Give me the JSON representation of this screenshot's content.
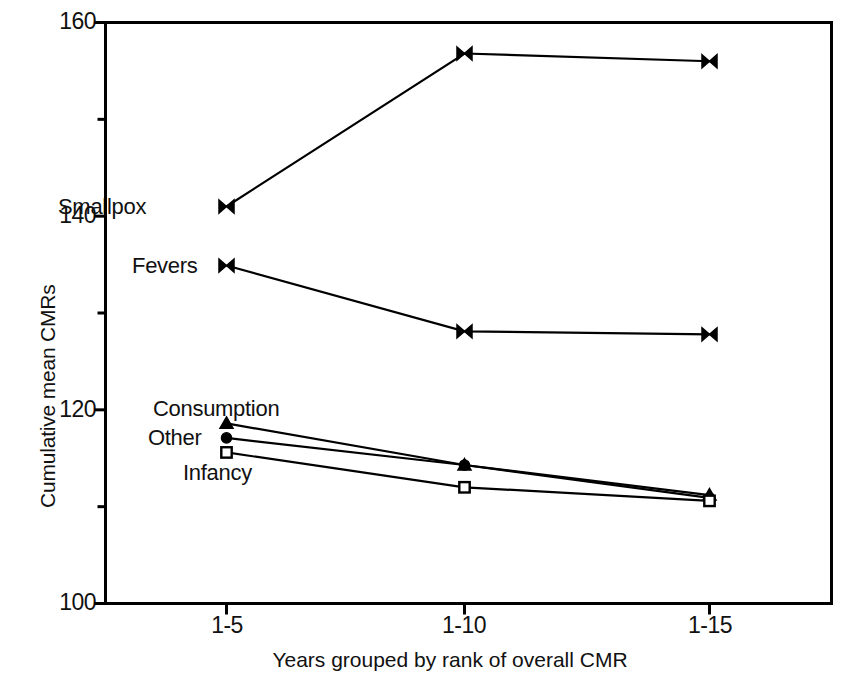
{
  "chart_data": {
    "type": "line",
    "title": "",
    "xlabel": "Years grouped by rank of overall CMR",
    "ylabel": "Cumulative mean CMRs",
    "categories": [
      "1-5",
      "1-10",
      "1-15"
    ],
    "xticklabels": [
      "1-5",
      "1-10",
      "1-15"
    ],
    "yticklabels": [
      "100",
      "120",
      "140",
      "160"
    ],
    "ylim": [
      100,
      160
    ],
    "yticks": [
      100,
      120,
      140,
      160
    ],
    "yminorticks": [
      110,
      130,
      150
    ],
    "grid": false,
    "legend": "inline-labels-left",
    "series": [
      {
        "name": "Smallpox",
        "marker": "bowtie",
        "values": [
          141.0,
          156.8,
          156.0
        ]
      },
      {
        "name": "Fevers",
        "marker": "bowtie",
        "values": [
          134.9,
          128.1,
          127.8
        ]
      },
      {
        "name": "Consumption",
        "marker": "triangle",
        "values": [
          118.6,
          114.3,
          111.2
        ]
      },
      {
        "name": "Other",
        "marker": "filled-circle",
        "values": [
          117.1,
          114.3,
          110.9
        ]
      },
      {
        "name": "Infancy",
        "marker": "open-square",
        "values": [
          115.6,
          112.0,
          110.6
        ]
      }
    ]
  },
  "axis": {
    "y_title": "Cumulative mean CMRs",
    "x_title": "Years grouped by rank of overall CMR",
    "y_ticks": [
      "160",
      "140",
      "120",
      "100"
    ],
    "x_ticks": [
      "1-5",
      "1-10",
      "1-15"
    ]
  },
  "series_labels": {
    "smallpox": "Smallpox",
    "fevers": "Fevers",
    "consumption": "Consumption",
    "other": "Other",
    "infancy": "Infancy"
  },
  "colors": {
    "line": "#000000",
    "frame": "#000000",
    "background": "#ffffff",
    "text": "#111111"
  }
}
